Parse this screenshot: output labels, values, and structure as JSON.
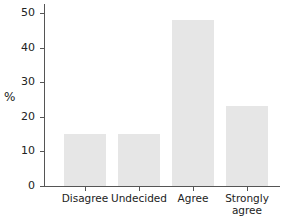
{
  "chart_data": {
    "type": "bar",
    "title": "",
    "xlabel": "",
    "ylabel": "%",
    "categories": [
      "Disagree",
      "Undecided",
      "Agree",
      "Strongly agree"
    ],
    "category_labels": [
      [
        "Disagree"
      ],
      [
        "Undecided"
      ],
      [
        "Agree"
      ],
      [
        "Strongly",
        "agree"
      ]
    ],
    "values": [
      15,
      15,
      48,
      23
    ],
    "ylim": [
      0,
      52
    ],
    "yticks": [
      0,
      10,
      20,
      30,
      40,
      50
    ],
    "ytick_labels": [
      "0",
      "10",
      "20",
      "30",
      "40",
      "50"
    ],
    "grid": false,
    "legend": null,
    "bar_color": "#e6e6e6",
    "axis_color": "#555555"
  }
}
